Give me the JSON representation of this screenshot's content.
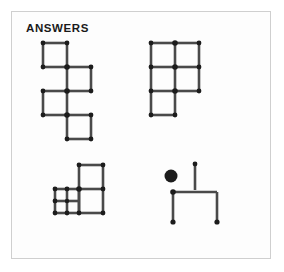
{
  "panel": {
    "title": "ANSWERS",
    "border_color": "#cfcfcf",
    "background_color": "#fdfdfd"
  },
  "style": {
    "match_stick_color": "#4a4a4a",
    "match_head_color": "#1c1c1c",
    "ball_color": "#1c1c1c",
    "stick_thickness": 2.6,
    "head_radius": 2.4,
    "cell": 24
  },
  "figures": [
    {
      "id": "fig-zigzag",
      "name": "four-square-staircase",
      "description": "Four squares arranged in a descending staircase, each touching the next at a corner",
      "square_count": 4,
      "squares": [
        {
          "col": 0,
          "row": 0
        },
        {
          "col": 1,
          "row": 1
        },
        {
          "col": 0,
          "row": 2
        },
        {
          "col": 1,
          "row": 3
        }
      ]
    },
    {
      "id": "fig-grid",
      "name": "five-square-grid",
      "description": "Two-by-two grid of squares with one extra square attached below the left column",
      "square_count": 5,
      "squares": [
        {
          "col": 0,
          "row": 0
        },
        {
          "col": 1,
          "row": 0
        },
        {
          "col": 0,
          "row": 1
        },
        {
          "col": 1,
          "row": 1
        },
        {
          "col": 0,
          "row": 2
        }
      ]
    },
    {
      "id": "fig-subdiv",
      "name": "subdivided-square-cluster",
      "description": "Large square subdivided into four small squares, with two full-size squares to its upper right and right",
      "square_count": 6,
      "big_squares": [
        {
          "col": 1,
          "row": 0
        },
        {
          "col": 1,
          "row": 1
        }
      ],
      "subdivided_square": {
        "col": 0,
        "row": 1,
        "sub_rows": 2,
        "sub_cols": 2
      }
    },
    {
      "id": "fig-stick",
      "name": "ball-and-table-figure",
      "description": "A filled circle beside a vertical match, above a horizontal match resting on two vertical matches",
      "ball": {
        "radius": 6.5
      },
      "match_count": 4
    }
  ]
}
